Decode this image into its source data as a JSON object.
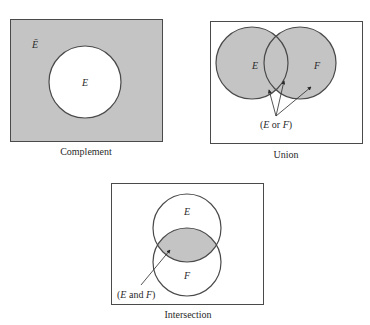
{
  "colors": {
    "shade": "#c4c4c4",
    "stroke": "#4a4a4a",
    "background": "#ffffff"
  },
  "diagrams": [
    {
      "id": "complement",
      "caption": "Complement",
      "labels": {
        "outside": "Ē",
        "set": "E"
      }
    },
    {
      "id": "union",
      "caption": "Union",
      "labels": {
        "set_e": "E",
        "set_f": "F"
      },
      "annotation": {
        "open": "(",
        "a": "E",
        "op": " or ",
        "b": "F",
        "close": ")"
      }
    },
    {
      "id": "intersection",
      "caption": "Intersection",
      "labels": {
        "set_e": "E",
        "set_f": "F"
      },
      "annotation": {
        "open": "(",
        "a": "E",
        "op": " and ",
        "b": "F",
        "close": ")"
      }
    }
  ]
}
